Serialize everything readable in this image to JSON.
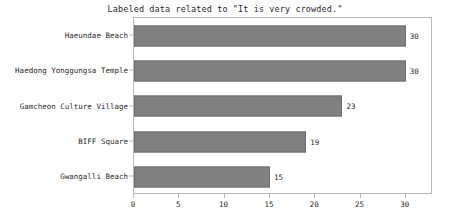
{
  "chart_data": {
    "type": "bar",
    "orientation": "horizontal",
    "title": "Labeled data related to \"It is very crowded.\"",
    "xlabel": "",
    "ylabel": "",
    "categories": [
      "Haeundae Beach",
      "Haedong Yonggungsa Temple",
      "Gamcheon Culture Village",
      "BIFF Square",
      "Gwangalli Beach"
    ],
    "values": [
      30,
      30,
      23,
      19,
      15
    ],
    "data_labels": [
      "30",
      "30",
      "23",
      "19",
      "15"
    ],
    "xticks": [
      0,
      5,
      10,
      15,
      20,
      25,
      30
    ],
    "xtick_labels": [
      "0",
      "5",
      "10",
      "15",
      "20",
      "25",
      "30"
    ],
    "xlim": [
      0,
      33
    ],
    "grid": false,
    "legend": false,
    "bar_color": "#808080",
    "bar_edge_color": "#6e6e6e",
    "axes_color": "#b9b9b9",
    "text_color": "#2a2a2a",
    "background_color": "#ffffff"
  }
}
